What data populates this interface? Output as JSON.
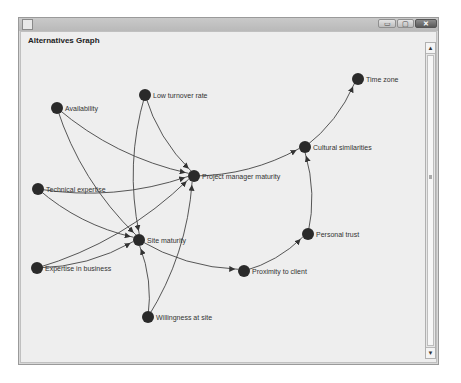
{
  "window": {
    "title": "",
    "controls": {
      "minimize": "▭",
      "maximize": "▢",
      "close": "✕"
    }
  },
  "panel": {
    "title": "Alternatives Graph"
  },
  "scrollbar": {
    "up": "▲",
    "down": "▼"
  },
  "graph": {
    "node_color": "#2a2a2a",
    "edge_color": "#444444",
    "nodes": [
      {
        "id": "availability",
        "label": "Availability",
        "x": 57,
        "y": 108
      },
      {
        "id": "low-turnover",
        "label": "Low turnover rate",
        "x": 145,
        "y": 95
      },
      {
        "id": "technical-expertise",
        "label": "Technical expertise",
        "x": 38,
        "y": 189
      },
      {
        "id": "project-manager-maturity",
        "label": "Project manager maturity",
        "x": 194,
        "y": 176
      },
      {
        "id": "site-maturity",
        "label": "Site maturity",
        "x": 139,
        "y": 240
      },
      {
        "id": "expertise-in-business",
        "label": "Expertise in business",
        "x": 37,
        "y": 268
      },
      {
        "id": "willingness-at-site",
        "label": "Willingness at site",
        "x": 148,
        "y": 317
      },
      {
        "id": "proximity-to-client",
        "label": "Proximity to client",
        "x": 244,
        "y": 271
      },
      {
        "id": "personal-trust",
        "label": "Personal trust",
        "x": 308,
        "y": 234
      },
      {
        "id": "cultural-similarities",
        "label": "Cultural similarities",
        "x": 305,
        "y": 147
      },
      {
        "id": "time-zone",
        "label": "Time zone",
        "x": 358,
        "y": 79
      }
    ],
    "edges": [
      {
        "from": "availability",
        "to": "project-manager-maturity"
      },
      {
        "from": "availability",
        "to": "site-maturity"
      },
      {
        "from": "low-turnover",
        "to": "project-manager-maturity"
      },
      {
        "from": "low-turnover",
        "to": "site-maturity"
      },
      {
        "from": "technical-expertise",
        "to": "project-manager-maturity"
      },
      {
        "from": "technical-expertise",
        "to": "site-maturity"
      },
      {
        "from": "expertise-in-business",
        "to": "project-manager-maturity"
      },
      {
        "from": "expertise-in-business",
        "to": "site-maturity"
      },
      {
        "from": "willingness-at-site",
        "to": "site-maturity"
      },
      {
        "from": "willingness-at-site",
        "to": "project-manager-maturity"
      },
      {
        "from": "site-maturity",
        "to": "proximity-to-client"
      },
      {
        "from": "proximity-to-client",
        "to": "personal-trust"
      },
      {
        "from": "personal-trust",
        "to": "cultural-similarities"
      },
      {
        "from": "project-manager-maturity",
        "to": "cultural-similarities"
      },
      {
        "from": "cultural-similarities",
        "to": "time-zone"
      }
    ]
  }
}
